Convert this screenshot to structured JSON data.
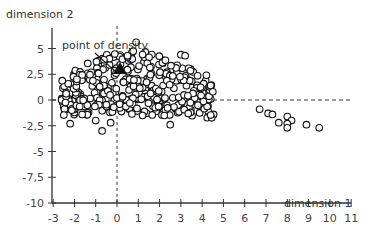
{
  "chart_data": {
    "type": "scatter",
    "title": "",
    "xlabel": "dimension 1",
    "ylabel": "dimension 2",
    "xlim": [
      -3,
      11
    ],
    "ylim": [
      -10,
      7
    ],
    "xticks": [
      -3,
      -2,
      -1,
      0,
      1,
      2,
      3,
      4,
      5,
      6,
      7,
      8,
      9,
      10,
      11
    ],
    "yticks": [
      5,
      2.5,
      0,
      -2.5,
      -5,
      -7.5,
      -10
    ],
    "ytick_labels": [
      "5",
      "2,5",
      "0",
      "-2,5",
      "-5",
      "-7,5",
      "-10"
    ],
    "grid": false,
    "reference_lines": {
      "vertical_x": 0,
      "horizontal_y": 0,
      "style": "dashed"
    },
    "annotations": [
      {
        "text": "point of density",
        "x": 0,
        "y": 3,
        "marker": "filled triangle"
      }
    ],
    "series": [
      {
        "name": "observations",
        "marker": "open circle",
        "points_outliers": [
          [
            6.7,
            -0.9
          ],
          [
            7.1,
            -1.3
          ],
          [
            7.3,
            -1.4
          ],
          [
            7.6,
            -2.2
          ],
          [
            8.0,
            -1.6
          ],
          [
            8.2,
            -2.0
          ],
          [
            8.0,
            -2.3
          ],
          [
            8.0,
            -2.7
          ],
          [
            8.9,
            -2.4
          ],
          [
            9.5,
            -2.7
          ],
          [
            4.5,
            0.8
          ],
          [
            4.4,
            1.4
          ],
          [
            4.2,
            2.4
          ],
          [
            3.0,
            4.4
          ],
          [
            3.2,
            4.3
          ],
          [
            -2.2,
            -2.3
          ],
          [
            -1.0,
            -2.0
          ],
          [
            -0.7,
            -3.0
          ],
          [
            -0.3,
            -2.2
          ],
          [
            2.5,
            -2.4
          ],
          [
            3.8,
            -0.5
          ],
          [
            1.2,
            -1.5
          ],
          [
            0.9,
            5.6
          ]
        ],
        "cluster": {
          "x_range": [
            -2.6,
            4.6
          ],
          "y_range": [
            -2.5,
            5.5
          ],
          "center": [
            0.5,
            1.5
          ],
          "approx_count": 350
        }
      }
    ]
  }
}
